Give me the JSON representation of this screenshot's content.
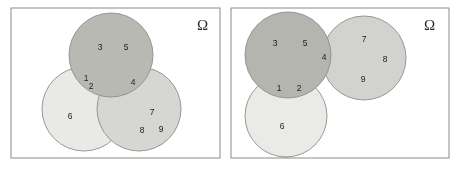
{
  "figure": {
    "width": 460,
    "height": 170,
    "background": "#ffffff"
  },
  "colors": {
    "frame_stroke": "#8a8a8a",
    "circle_stroke": "#8d8d8d",
    "circle_light": "#e9e9e6",
    "circle_medium": "#cfcfcb",
    "circle_dark": "#ababa6",
    "label_text": "#1c1c1c",
    "omega_text": "#2b2b2b"
  },
  "panels": [
    {
      "id": "left-panel",
      "name": "left-venn-panel",
      "universe_symbol": "Ω",
      "frame": {
        "x": 11,
        "y": 8,
        "width": 209,
        "height": 150
      },
      "omega_position": {
        "x": 197,
        "y": 30
      },
      "circles": [
        {
          "id": "left-top-circle",
          "name": "circle-top",
          "cx": 111,
          "cy": 55,
          "r": 42,
          "shade": "dark"
        },
        {
          "id": "left-bottomleft",
          "name": "circle-bottom-left",
          "cx": 84,
          "cy": 109,
          "r": 42,
          "shade": "light"
        },
        {
          "id": "left-bottomright",
          "name": "circle-bottom-right",
          "cx": 139,
          "cy": 109,
          "r": 42,
          "shade": "medium"
        }
      ],
      "labels": [
        {
          "text": "3",
          "x": 100,
          "y": 48,
          "region": "top-circle-only"
        },
        {
          "text": "5",
          "x": 126,
          "y": 48,
          "region": "top-circle-only"
        },
        {
          "text": "1",
          "x": 86,
          "y": 79,
          "region": "top-and-bottom-left"
        },
        {
          "text": "2",
          "x": 91,
          "y": 87,
          "region": "top-and-bottom-left"
        },
        {
          "text": "4",
          "x": 133,
          "y": 83,
          "region": "top-and-bottom-right"
        },
        {
          "text": "6",
          "x": 70,
          "y": 117,
          "region": "bottom-left-only"
        },
        {
          "text": "7",
          "x": 152,
          "y": 113,
          "region": "bottom-right-only"
        },
        {
          "text": "8",
          "x": 142,
          "y": 131,
          "region": "bottom-right-only"
        },
        {
          "text": "9",
          "x": 161,
          "y": 130,
          "region": "bottom-right-only"
        }
      ]
    },
    {
      "id": "right-panel",
      "name": "right-venn-panel",
      "universe_symbol": "Ω",
      "frame": {
        "x": 231,
        "y": 8,
        "width": 218,
        "height": 150
      },
      "omega_position": {
        "x": 424,
        "y": 30
      },
      "circles": [
        {
          "id": "right-topleft",
          "name": "circle-top-left",
          "cx": 288,
          "cy": 55,
          "r": 43,
          "shade": "dark"
        },
        {
          "id": "right-topright",
          "name": "circle-top-right",
          "cx": 364,
          "cy": 58,
          "r": 42,
          "shade": "medium"
        },
        {
          "id": "right-bottom",
          "name": "circle-bottom",
          "cx": 286,
          "cy": 116,
          "r": 41,
          "shade": "light"
        }
      ],
      "labels": [
        {
          "text": "3",
          "x": 275,
          "y": 44,
          "region": "top-left-only"
        },
        {
          "text": "5",
          "x": 305,
          "y": 44,
          "region": "top-left-only"
        },
        {
          "text": "4",
          "x": 324,
          "y": 58,
          "region": "top-left-and-top-right"
        },
        {
          "text": "7",
          "x": 364,
          "y": 40,
          "region": "top-right-only"
        },
        {
          "text": "8",
          "x": 385,
          "y": 60,
          "region": "top-right-only"
        },
        {
          "text": "9",
          "x": 363,
          "y": 80,
          "region": "top-right-only"
        },
        {
          "text": "1",
          "x": 279,
          "y": 89,
          "region": "top-left-and-bottom"
        },
        {
          "text": "2",
          "x": 299,
          "y": 89,
          "region": "top-left-and-bottom"
        },
        {
          "text": "6",
          "x": 282,
          "y": 127,
          "region": "bottom-only"
        }
      ]
    }
  ]
}
